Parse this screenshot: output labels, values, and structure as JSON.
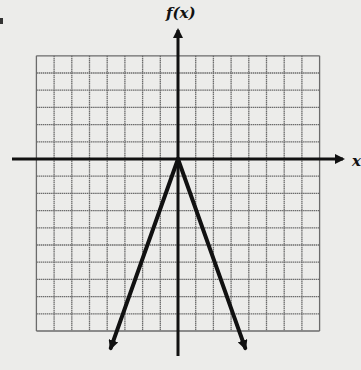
{
  "chart_data": {
    "type": "line",
    "title": "",
    "ylabel": "f(x)",
    "xlabel": "x",
    "grid": true,
    "grid_units_per_cell": 1,
    "xlim": [
      -8,
      8
    ],
    "ylim": [
      -10,
      6
    ],
    "axes_arrows": {
      "x_positive": true,
      "y_positive": true
    },
    "series": [
      {
        "name": "f(x)",
        "description": "inverted absolute-value graph with vertex at origin, both rays pointing downward",
        "function": "f(x) = -3|x|",
        "vertex": [
          0,
          0
        ],
        "rays": [
          {
            "from": [
              0,
              0
            ],
            "to": [
              -3.8,
              -11
            ],
            "arrow": true
          },
          {
            "from": [
              0,
              0
            ],
            "to": [
              3.8,
              -11
            ],
            "arrow": true
          }
        ],
        "color": "#111111"
      }
    ]
  },
  "labels": {
    "y_axis": "f(x)",
    "x_axis": "x"
  },
  "colors": {
    "background": "#ececea",
    "grid": "#6b6b6b",
    "axes": "#111111",
    "curve": "#111111"
  }
}
